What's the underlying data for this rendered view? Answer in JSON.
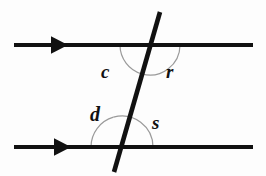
{
  "figure": {
    "background_color": "#fdfdfd",
    "width": 266,
    "height": 176
  },
  "style": {
    "line_color": "#111111",
    "line_width": 4.2,
    "transversal_width": 4.6,
    "arc_color": "#9a9a9a",
    "arc_width": 1.2,
    "label_color": "#111111"
  },
  "chart_data": {
    "type": "diagram",
    "subtype": "geometry-parallel-lines-transversal",
    "lines": [
      {
        "name": "upper-parallel-line",
        "kind": "parallel",
        "x1": 14,
        "y1": 45,
        "x2": 253,
        "y2": 45,
        "direction_marker": "arrowhead-right",
        "marker_x": 62
      },
      {
        "name": "lower-parallel-line",
        "kind": "parallel",
        "x1": 14,
        "y1": 147,
        "x2": 253,
        "y2": 147,
        "direction_marker": "arrowhead-right",
        "marker_x": 65
      },
      {
        "name": "transversal-line",
        "kind": "transversal",
        "x1": 160,
        "y1": 12,
        "x2": 114,
        "y2": 172,
        "direction_marker": "none"
      }
    ],
    "intersections": [
      {
        "name": "upper-intersection",
        "x": 150,
        "y": 45
      },
      {
        "name": "lower-intersection",
        "x": 122,
        "y": 147
      }
    ],
    "angles": [
      {
        "label": "c",
        "at": "upper-intersection",
        "position": "below-left",
        "cx": 150,
        "cy": 45,
        "radius": 30,
        "start_deg": 180,
        "end_deg": 106,
        "label_x": 101,
        "label_y": 62
      },
      {
        "label": "r",
        "at": "upper-intersection",
        "position": "below-right",
        "cx": 150,
        "cy": 45,
        "radius": 30,
        "start_deg": 106,
        "end_deg": 0,
        "label_x": 166,
        "label_y": 62
      },
      {
        "label": "d",
        "at": "lower-intersection",
        "position": "above-left",
        "cx": 122,
        "cy": 147,
        "radius": 31,
        "start_deg": 180,
        "end_deg": 106,
        "label_x": 90,
        "label_y": 104
      },
      {
        "label": "s",
        "at": "lower-intersection",
        "position": "above-right",
        "cx": 122,
        "cy": 147,
        "radius": 31,
        "start_deg": 106,
        "end_deg": 0,
        "label_x": 152,
        "label_y": 113
      }
    ],
    "labels": {
      "c": "c",
      "r": "r",
      "d": "d",
      "s": "s"
    },
    "arrowheads": [
      {
        "name": "upper-arrowhead",
        "x": 62,
        "y": 45,
        "direction": "right",
        "size": 11
      },
      {
        "name": "lower-arrowhead",
        "x": 65,
        "y": 147,
        "direction": "right",
        "size": 11
      }
    ]
  }
}
